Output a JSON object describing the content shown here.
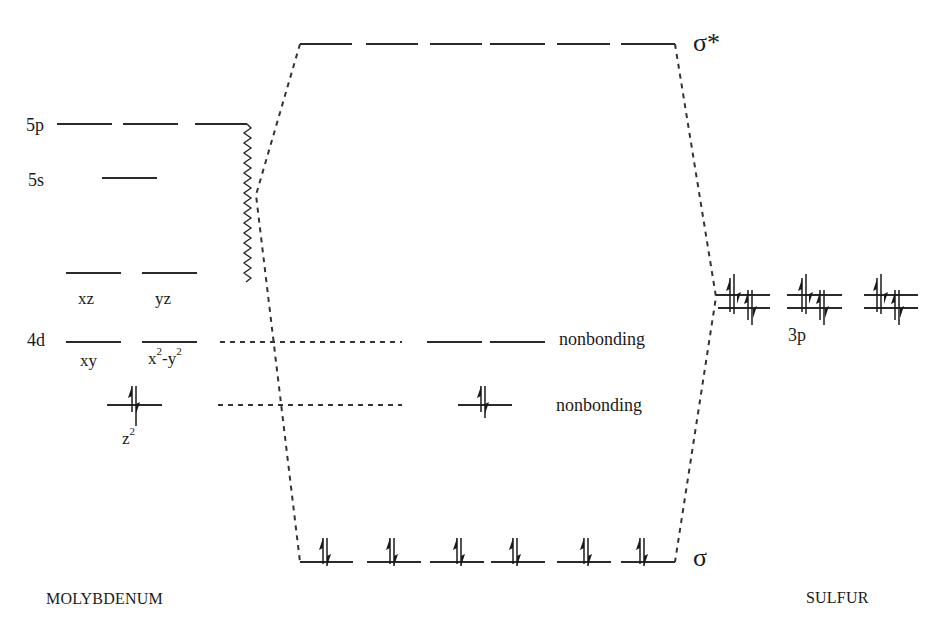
{
  "diagram": {
    "type": "molecular-orbital-energy-diagram",
    "left_atom": {
      "label": "MOLYBDENUM",
      "levels": [
        {
          "name": "5p",
          "label": "5p",
          "orbitals": 3,
          "electrons": 0
        },
        {
          "name": "5s",
          "label": "5s",
          "orbitals": 1,
          "electrons": 0
        },
        {
          "name": "4d-upper",
          "orbitals": 2,
          "orbital_labels": [
            "xz",
            "yz"
          ],
          "electrons": 0
        },
        {
          "name": "4d",
          "label": "4d",
          "orbitals": 2,
          "orbital_labels": [
            "xy",
            "x2-y2"
          ],
          "electrons": 0
        },
        {
          "name": "4d-z2",
          "orbitals": 1,
          "orbital_labels": [
            "z2"
          ],
          "electrons": 2
        }
      ],
      "orbital_label_parts": {
        "xz": "xz",
        "yz": "yz",
        "xy": "xy",
        "x2y2_base1": "x",
        "x2y2_sup1": "2",
        "x2y2_mid": "-y",
        "x2y2_sup2": "2",
        "z2_base": "z",
        "z2_sup": "2"
      }
    },
    "right_atom": {
      "label": "SULFUR",
      "levels": [
        {
          "name": "3p",
          "label": "3p",
          "groups": 3,
          "orbitals_per_group": 2,
          "electrons_per_orbital": 2
        }
      ]
    },
    "molecular": {
      "sigma_star": {
        "label": "σ*",
        "orbitals": 6,
        "electrons": 0
      },
      "nonbonding_upper": {
        "label": "nonbonding",
        "orbitals": 2,
        "electrons": 0
      },
      "nonbonding_lower": {
        "label": "nonbonding",
        "orbitals": 1,
        "electrons": 2
      },
      "sigma": {
        "label": "σ",
        "orbitals": 6,
        "electrons": 12
      }
    },
    "text": {
      "mo_5p": "5p",
      "mo_5s": "5s",
      "mo_4d": "4d",
      "xz": "xz",
      "yz": "yz",
      "xy": "xy",
      "sigma_star": "σ*",
      "sigma": "σ",
      "nonbonding_1": "nonbonding",
      "nonbonding_2": "nonbonding",
      "s_3p": "3p",
      "molybdenum": "MOLYBDENUM",
      "sulfur": "SULFUR"
    }
  }
}
